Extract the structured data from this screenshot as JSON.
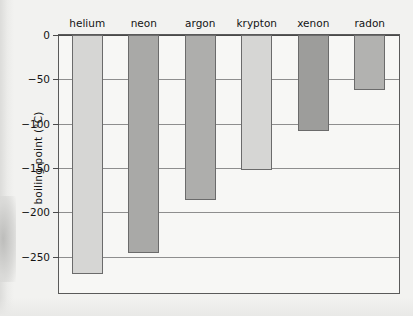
{
  "chart_data": {
    "type": "bar",
    "title": "",
    "subtitle": "",
    "xlabel": "",
    "ylabel": "boiling point (°C)",
    "categories": [
      "helium",
      "neon",
      "argon",
      "krypton",
      "xenon",
      "radon"
    ],
    "values": [
      -270,
      -246,
      -186,
      -152,
      -108,
      -62
    ],
    "series": [
      {
        "name": "boiling point",
        "values": [
          -270,
          -246,
          -186,
          -152,
          -108,
          -62
        ]
      }
    ],
    "bar_colors": [
      "#d6d6d4",
      "#a9a9a7",
      "#aeaeac",
      "#d6d6d4",
      "#9d9d9b",
      "#b2b2b0"
    ],
    "bar_border_color": "#6b6b6b",
    "ylim": [
      -290,
      0
    ],
    "yticks": [
      0,
      -50,
      -100,
      -150,
      -200,
      -250
    ],
    "ytick_labels": [
      "0",
      "−50",
      "−100",
      "−150",
      "−200",
      "−250"
    ],
    "grid": true,
    "grid_axis": "y",
    "grid_color": "#8e8e8e",
    "legend": false,
    "legend_position": "none",
    "axis_color": "#5a5a5a",
    "plot_background": "#f7f7f5",
    "figure_background": "#f2f2f0"
  }
}
